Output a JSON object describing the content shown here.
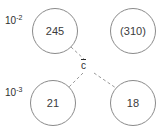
{
  "figure": {
    "width": 164,
    "height": 135,
    "background_color": "#ffffff",
    "node_stroke_color": "#8a8a8a",
    "edge_stroke_color": "#9a9a9a",
    "text_color": "#2e2e2e"
  },
  "row_labels": {
    "top": {
      "base": "10",
      "exponent": "-2"
    },
    "bottom": {
      "base": "10",
      "exponent": "-3"
    }
  },
  "center": {
    "label": "c",
    "has_overbar": true
  },
  "nodes": [
    {
      "id": "top-left",
      "label": "245",
      "row": "10^-2",
      "cx": 55,
      "cy": 31,
      "r": 23
    },
    {
      "id": "top-right",
      "label": "(310)",
      "row": "10^-2",
      "cx": 133,
      "cy": 31,
      "r": 23
    },
    {
      "id": "bottom-left",
      "label": "21",
      "row": "10^-3",
      "cx": 53,
      "cy": 103,
      "r": 23
    },
    {
      "id": "bottom-right",
      "label": "18",
      "row": "10^-3",
      "cx": 133,
      "cy": 103,
      "r": 23
    }
  ],
  "edges": [
    {
      "from": "center",
      "to": "top-left",
      "style": "dashed"
    },
    {
      "from": "center",
      "to": "bottom-left",
      "style": "dashed"
    },
    {
      "from": "center",
      "to": "bottom-right",
      "style": "dashed"
    }
  ]
}
